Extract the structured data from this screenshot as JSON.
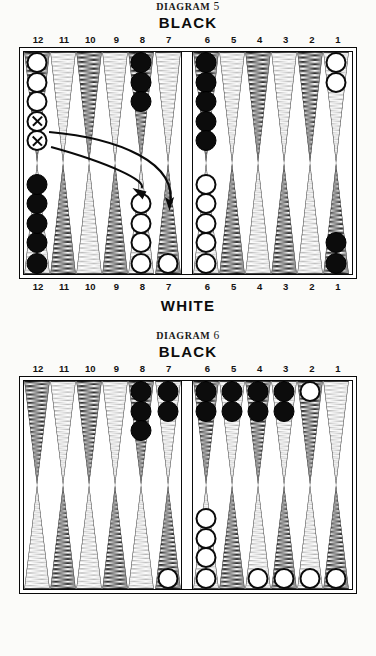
{
  "page": {
    "background_color": "#fbfbf9",
    "ink_color": "#0c0c0c"
  },
  "diagrams": [
    {
      "id": "diagram-5",
      "title_word": "DIAGRAM",
      "title_number": "5",
      "top_player_label": "BLACK",
      "bottom_player_label": "WHITE",
      "point_numbers_top": [
        "12",
        "11",
        "10",
        "9",
        "8",
        "7",
        "6",
        "5",
        "4",
        "3",
        "2",
        "1"
      ],
      "point_numbers_bottom": [
        "12",
        "11",
        "10",
        "9",
        "8",
        "7",
        "6",
        "5",
        "4",
        "3",
        "2",
        "1"
      ],
      "has_bottom_numbers": true,
      "has_bottom_player_label": true,
      "annotations": {
        "arrows": [
          {
            "name": "arrow-12-to-8",
            "from_point": "12",
            "to_point": "8",
            "direction": "right-down"
          },
          {
            "name": "arrow-12-to-7",
            "from_point": "12",
            "to_point": "7",
            "direction": "right-down"
          }
        ],
        "marked_checkers_note": "two white checkers on point 12 are marked with an X"
      },
      "points": {
        "top": [
          {
            "num": "12",
            "color": "white",
            "count": 5,
            "marked_from_end": 2
          },
          {
            "num": "11",
            "color": null,
            "count": 0,
            "marked_from_end": 0
          },
          {
            "num": "10",
            "color": null,
            "count": 0,
            "marked_from_end": 0
          },
          {
            "num": "9",
            "color": null,
            "count": 0,
            "marked_from_end": 0
          },
          {
            "num": "8",
            "color": "black",
            "count": 3,
            "marked_from_end": 0
          },
          {
            "num": "7",
            "color": null,
            "count": 0,
            "marked_from_end": 0
          },
          {
            "num": "6",
            "color": "black",
            "count": 5,
            "marked_from_end": 0
          },
          {
            "num": "5",
            "color": null,
            "count": 0,
            "marked_from_end": 0
          },
          {
            "num": "4",
            "color": null,
            "count": 0,
            "marked_from_end": 0
          },
          {
            "num": "3",
            "color": null,
            "count": 0,
            "marked_from_end": 0
          },
          {
            "num": "2",
            "color": null,
            "count": 0,
            "marked_from_end": 0
          },
          {
            "num": "1",
            "color": "white",
            "count": 2,
            "marked_from_end": 0
          }
        ],
        "bottom": [
          {
            "num": "12",
            "color": "black",
            "count": 5,
            "marked_from_end": 0
          },
          {
            "num": "11",
            "color": null,
            "count": 0,
            "marked_from_end": 0
          },
          {
            "num": "10",
            "color": null,
            "count": 0,
            "marked_from_end": 0
          },
          {
            "num": "9",
            "color": null,
            "count": 0,
            "marked_from_end": 0
          },
          {
            "num": "8",
            "color": "white",
            "count": 4,
            "marked_from_end": 0
          },
          {
            "num": "7",
            "color": "white",
            "count": 1,
            "marked_from_end": 0
          },
          {
            "num": "6",
            "color": "white",
            "count": 5,
            "marked_from_end": 0
          },
          {
            "num": "5",
            "color": null,
            "count": 0,
            "marked_from_end": 0
          },
          {
            "num": "4",
            "color": null,
            "count": 0,
            "marked_from_end": 0
          },
          {
            "num": "3",
            "color": null,
            "count": 0,
            "marked_from_end": 0
          },
          {
            "num": "2",
            "color": null,
            "count": 0,
            "marked_from_end": 0
          },
          {
            "num": "1",
            "color": "black",
            "count": 2,
            "marked_from_end": 0
          }
        ]
      }
    },
    {
      "id": "diagram-6",
      "title_word": "DIAGRAM",
      "title_number": "6",
      "top_player_label": "BLACK",
      "bottom_player_label": "",
      "point_numbers_top": [
        "12",
        "11",
        "10",
        "9",
        "8",
        "7",
        "6",
        "5",
        "4",
        "3",
        "2",
        "1"
      ],
      "point_numbers_bottom": [],
      "has_bottom_numbers": false,
      "has_bottom_player_label": false,
      "annotations": {
        "arrows": [],
        "marked_checkers_note": ""
      },
      "points": {
        "top": [
          {
            "num": "12",
            "color": null,
            "count": 0,
            "marked_from_end": 0
          },
          {
            "num": "11",
            "color": null,
            "count": 0,
            "marked_from_end": 0
          },
          {
            "num": "10",
            "color": null,
            "count": 0,
            "marked_from_end": 0
          },
          {
            "num": "9",
            "color": null,
            "count": 0,
            "marked_from_end": 0
          },
          {
            "num": "8",
            "color": "black",
            "count": 3,
            "marked_from_end": 0
          },
          {
            "num": "7",
            "color": "black",
            "count": 2,
            "marked_from_end": 0
          },
          {
            "num": "6",
            "color": "black",
            "count": 2,
            "marked_from_end": 0
          },
          {
            "num": "5",
            "color": "black",
            "count": 2,
            "marked_from_end": 0
          },
          {
            "num": "4",
            "color": "black",
            "count": 2,
            "marked_from_end": 0
          },
          {
            "num": "3",
            "color": "black",
            "count": 2,
            "marked_from_end": 0
          },
          {
            "num": "2",
            "color": "white",
            "count": 1,
            "marked_from_end": 0
          },
          {
            "num": "1",
            "color": null,
            "count": 0,
            "marked_from_end": 0
          }
        ],
        "bottom": [
          {
            "num": "12",
            "color": null,
            "count": 0,
            "marked_from_end": 0
          },
          {
            "num": "11",
            "color": null,
            "count": 0,
            "marked_from_end": 0
          },
          {
            "num": "10",
            "color": null,
            "count": 0,
            "marked_from_end": 0
          },
          {
            "num": "9",
            "color": null,
            "count": 0,
            "marked_from_end": 0
          },
          {
            "num": "8",
            "color": null,
            "count": 0,
            "marked_from_end": 0
          },
          {
            "num": "7",
            "color": "white",
            "count": 1,
            "marked_from_end": 0
          },
          {
            "num": "6",
            "color": "white",
            "count": 4,
            "marked_from_end": 0
          },
          {
            "num": "5",
            "color": null,
            "count": 0,
            "marked_from_end": 0
          },
          {
            "num": "4",
            "color": "white",
            "count": 1,
            "marked_from_end": 0
          },
          {
            "num": "3",
            "color": "white",
            "count": 1,
            "marked_from_end": 0
          },
          {
            "num": "2",
            "color": "white",
            "count": 1,
            "marked_from_end": 0
          },
          {
            "num": "1",
            "color": "white",
            "count": 1,
            "marked_from_end": 0
          }
        ]
      }
    }
  ]
}
